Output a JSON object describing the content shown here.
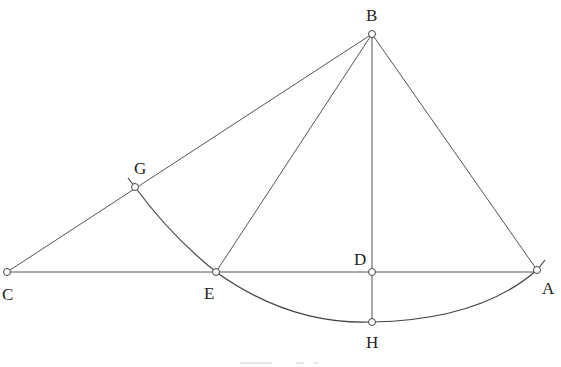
{
  "figure": {
    "type": "geometric-construction",
    "stroke_color": "#555555",
    "background": "#ffffff",
    "points": {
      "A": {
        "label": "A",
        "x": 537,
        "y": 270,
        "label_x": 548,
        "label_y": 294
      },
      "B": {
        "label": "B",
        "x": 372,
        "y": 34,
        "label_x": 373,
        "label_y": 21
      },
      "C": {
        "label": "C",
        "x": 7,
        "y": 272,
        "label_x": 8,
        "label_y": 300
      },
      "D": {
        "label": "D",
        "x": 372,
        "y": 272,
        "label_x": 361,
        "label_y": 265
      },
      "E": {
        "label": "E",
        "x": 216,
        "y": 272,
        "label_x": 210,
        "label_y": 299
      },
      "G": {
        "label": "G",
        "x": 135,
        "y": 187,
        "label_x": 141,
        "label_y": 174
      },
      "H": {
        "label": "H",
        "x": 372,
        "y": 322,
        "label_x": 372,
        "label_y": 348
      }
    },
    "segments": [
      [
        "C",
        "B"
      ],
      [
        "B",
        "A"
      ],
      [
        "B",
        "E"
      ],
      [
        "B",
        "H"
      ],
      [
        "C",
        "A"
      ]
    ],
    "arcs": [
      {
        "name": "arc-G-E",
        "from": "G",
        "to": "E",
        "description": "arc from G down to E"
      },
      {
        "name": "arc-E-H-A",
        "from": "E",
        "through": "H",
        "to": "A",
        "description": "arc from E through H to A"
      }
    ],
    "caption": {
      "text": "",
      "note": "caption cut off at bottom edge, unreadable"
    }
  }
}
